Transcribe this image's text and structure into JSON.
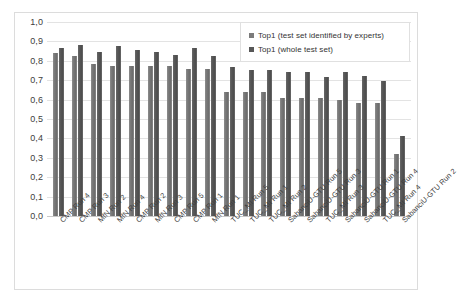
{
  "chart_data": {
    "type": "bar",
    "title": "",
    "subtitle": "",
    "xlabel": "",
    "ylabel": "",
    "ylim": [
      0.0,
      1.0
    ],
    "grid": true,
    "legend_position": "top-right",
    "y_ticks": [
      "0,0",
      "0,1",
      "0,2",
      "0,3",
      "0,4",
      "0,5",
      "0,6",
      "0,7",
      "0,8",
      "0,9",
      "1,0"
    ],
    "y_tick_values": [
      0.0,
      0.1,
      0.2,
      0.3,
      0.4,
      0.5,
      0.6,
      0.7,
      0.8,
      0.9,
      1.0
    ],
    "decimal_separator": ",",
    "categories": [
      "CMP Run 4",
      "CMP Run 3",
      "MfN Run 2",
      "MfN Run 4",
      "CMP Run 2",
      "MfN Run 3",
      "CMP Run 5",
      "CMP Run 1",
      "MfN Run 1",
      "TUC_MI Run 5",
      "TUC_MI Run 1",
      "TUC_MI Run 2",
      "SabanciU-GTU Run 5",
      "SabanciU-GTU Run 3",
      "TUC_MI Run 3",
      "SabanciU-GTU Run 1",
      "SabanciU-GTU Run 4",
      "TUC_MI Run 4",
      "SabanciU-GTU Run 2"
    ],
    "series": [
      {
        "name": "Top1 (test set identified by experts)",
        "color": "#7b7b7b",
        "values": [
          0.84,
          0.825,
          0.785,
          0.775,
          0.775,
          0.775,
          0.775,
          0.76,
          0.76,
          0.64,
          0.64,
          0.64,
          0.61,
          0.61,
          0.61,
          0.6,
          0.585,
          0.585,
          0.32
        ]
      },
      {
        "name": "Top1 (whole test set)",
        "color": "#575757",
        "values": [
          0.865,
          0.88,
          0.845,
          0.875,
          0.855,
          0.845,
          0.83,
          0.865,
          0.825,
          0.77,
          0.755,
          0.755,
          0.74,
          0.74,
          0.715,
          0.74,
          0.72,
          0.695,
          0.415
        ]
      }
    ]
  },
  "legend": {
    "items": [
      {
        "label": "Top1 (test set identified by experts)"
      },
      {
        "label": "Top1 (whole test set)"
      }
    ]
  }
}
